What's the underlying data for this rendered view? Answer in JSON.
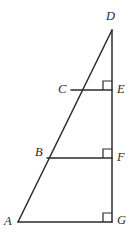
{
  "figure": {
    "kind": "geometry-diagram",
    "stroke_color": "#2b2b2b",
    "background_color": "#ffffff",
    "labels": {
      "A": "A",
      "B": "B",
      "C": "C",
      "D": "D",
      "E": "E",
      "F": "F",
      "G": "G"
    },
    "points": {
      "A": {
        "x": 18,
        "y": 222
      },
      "B": {
        "x": 47,
        "y": 158
      },
      "C": {
        "x": 71,
        "y": 90
      },
      "D": {
        "x": 112,
        "y": 30
      },
      "E": {
        "x": 112,
        "y": 90
      },
      "F": {
        "x": 112,
        "y": 158
      },
      "G": {
        "x": 112,
        "y": 222
      }
    },
    "segments": [
      {
        "name": "AD",
        "from": "A",
        "to": "D"
      },
      {
        "name": "DG",
        "from": "D",
        "to": "G"
      },
      {
        "name": "AG",
        "from": "A",
        "to": "G"
      },
      {
        "name": "CE",
        "from": "C",
        "to": "E"
      },
      {
        "name": "BF",
        "from": "B",
        "to": "F"
      }
    ],
    "right_angles": [
      {
        "at": "E",
        "size": 9
      },
      {
        "at": "F",
        "size": 9
      },
      {
        "at": "G",
        "size": 9
      }
    ]
  }
}
